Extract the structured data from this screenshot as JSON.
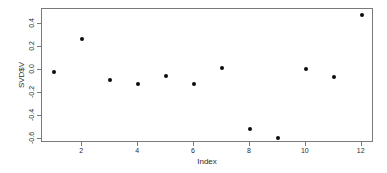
{
  "chart_data": {
    "type": "scatter",
    "title": "",
    "xlabel": "Index",
    "ylabel": "SVD$V",
    "x": [
      1,
      2,
      3,
      4,
      5,
      6,
      7,
      8,
      9,
      10,
      11,
      12
    ],
    "values": [
      -0.02,
      0.27,
      -0.09,
      -0.12,
      -0.05,
      -0.12,
      0.02,
      -0.51,
      -0.59,
      0.01,
      -0.06,
      0.48
    ],
    "xticks": [
      2,
      4,
      6,
      8,
      10,
      12
    ],
    "xtick_labels": [
      "2",
      "4",
      "6",
      "8",
      "10",
      "12"
    ],
    "yticks": [
      0.4,
      0.2,
      0.0,
      -0.2,
      -0.4,
      -0.6
    ],
    "ytick_labels": [
      "0.4",
      "0.2",
      "0.0",
      "-0.2",
      "-0.4",
      "-0.6"
    ],
    "xlim": [
      0.56,
      12.44
    ],
    "ylim": [
      -0.633,
      0.528
    ],
    "grid": false,
    "legend": null,
    "point_color": "#0d0d0d",
    "axis_color": "#7a7a7a",
    "text_color": "#2b2b2b",
    "background_color": "#ffffff"
  }
}
